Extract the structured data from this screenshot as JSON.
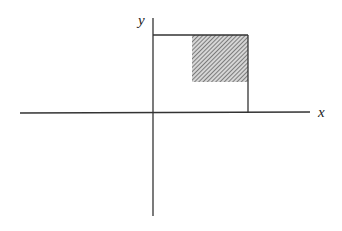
{
  "diagram": {
    "x_axis_label": "x",
    "y_axis_label": "y",
    "colors": {
      "axis": "#333333",
      "hatch": "#555555",
      "hatch_bg": "#cfcfcf"
    },
    "elements": [
      {
        "type": "axis",
        "name": "x-axis"
      },
      {
        "type": "axis",
        "name": "y-axis"
      },
      {
        "type": "rectangle-outline",
        "name": "bounding-region",
        "sides": [
          "top",
          "right"
        ]
      },
      {
        "type": "hatched-rectangle",
        "name": "shaded-region"
      }
    ]
  }
}
